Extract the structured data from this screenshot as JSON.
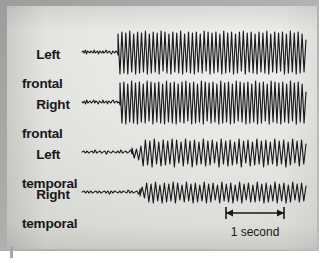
{
  "figure": {
    "background_color": "#b4b4b4",
    "plate_color": "#e7e7e4",
    "trace_color": "#1b1b1f",
    "label_color": "#17171a"
  },
  "channels": [
    {
      "line1": "Left",
      "line2": "frontal",
      "name": "left-frontal"
    },
    {
      "line1": "Right",
      "line2": "frontal",
      "name": "right-frontal"
    },
    {
      "line1": "Left",
      "line2": "temporal",
      "name": "left-temporal"
    },
    {
      "line1": "Right",
      "line2": "temporal",
      "name": "right-temporal"
    }
  ],
  "scale_bar": {
    "caption": "1 second",
    "x_start": 226,
    "x_end": 284,
    "y": 213
  },
  "chart_data": {
    "type": "line",
    "xlabel": "time",
    "ylabel": "amplitude",
    "grid": false,
    "legend": "none",
    "x_range": [
      82,
      306
    ],
    "scale_bar_seconds": 1,
    "scale_bar_pixels": 58,
    "series": [
      {
        "name": "Left frontal",
        "baseline_y": 52,
        "onset_x": 118,
        "preictal_amplitude": 3.5,
        "ictal_amplitude": 23,
        "spike_period_px": 12.2,
        "morphology": "spike-and-slow-wave",
        "values": [
          0,
          1,
          -1,
          2,
          -2,
          1,
          0,
          -1,
          1,
          0,
          -1,
          2,
          -1,
          0,
          1,
          -2,
          1,
          0,
          -1,
          1,
          -1,
          0,
          2,
          -1,
          0,
          1,
          -1,
          -2,
          1,
          0,
          -1,
          1,
          0,
          -3,
          18,
          -22,
          20,
          -21,
          19,
          -22,
          21,
          -20,
          18,
          -22,
          20,
          -21,
          19,
          -20,
          21,
          -22,
          18,
          -21,
          20,
          -20,
          19,
          -22,
          21,
          -19,
          20,
          -21,
          18,
          -22,
          20,
          -20,
          19,
          -21,
          21,
          -22,
          18,
          -20,
          20,
          -21,
          19,
          -22,
          20,
          -20,
          18,
          -21,
          21,
          -19,
          20,
          -22,
          19,
          -21,
          20,
          -20,
          18,
          -22,
          21,
          -21,
          19,
          -20,
          20,
          -22,
          18,
          -21,
          20,
          -19,
          21,
          -22,
          19,
          -20,
          20,
          -21,
          18,
          -22,
          20,
          -20,
          19,
          -21,
          21,
          -22,
          18,
          -20,
          20,
          -21,
          19,
          -19,
          20,
          -22,
          18,
          -21,
          21,
          -20,
          19,
          -22,
          20,
          -21,
          18,
          -20,
          12
        ]
      },
      {
        "name": "Right frontal",
        "baseline_y": 102,
        "onset_x": 120,
        "preictal_amplitude": 3.5,
        "ictal_amplitude": 23,
        "spike_period_px": 12.2,
        "morphology": "spike-and-slow-wave",
        "values": [
          0,
          -1,
          1,
          -2,
          2,
          -1,
          0,
          1,
          -1,
          0,
          2,
          -1,
          1,
          0,
          -2,
          1,
          0,
          -1,
          2,
          -1,
          0,
          1,
          -2,
          1,
          0,
          -1,
          1,
          2,
          -1,
          0,
          1,
          -1,
          0,
          -3,
          19,
          -21,
          20,
          -22,
          18,
          -20,
          21,
          -21,
          19,
          -22,
          20,
          -20,
          18,
          -21,
          21,
          -19,
          20,
          -22,
          19,
          -20,
          20,
          -21,
          18,
          -22,
          21,
          -20,
          19,
          -21,
          20,
          -22,
          18,
          -20,
          20,
          -21,
          21,
          -19,
          19,
          -22,
          20,
          -21,
          18,
          -20,
          21,
          -22,
          20,
          -19,
          19,
          -21,
          20,
          -20,
          18,
          -22,
          21,
          -21,
          19,
          -20,
          20,
          -22,
          18,
          -21,
          21,
          -19,
          20,
          -20,
          19,
          -22,
          20,
          -21,
          18,
          -20,
          21,
          -22,
          19,
          -21,
          20,
          -19,
          18,
          -22,
          21,
          -20,
          20,
          -21,
          19,
          -22,
          20,
          -20,
          18,
          -21,
          21,
          -19,
          19,
          -22,
          20,
          -20,
          18,
          -21,
          10
        ]
      },
      {
        "name": "Left temporal",
        "baseline_y": 152,
        "onset_x": 132,
        "preictal_amplitude": 3,
        "ictal_amplitude": 15,
        "spike_period_px": 11.0,
        "morphology": "polyspike-and-wave",
        "values": [
          0,
          1,
          -1,
          1,
          -1,
          0,
          1,
          -1,
          2,
          -1,
          0,
          1,
          -1,
          0,
          1,
          -2,
          1,
          0,
          -1,
          1,
          0,
          -1,
          1,
          -1,
          2,
          -1,
          0,
          1,
          -1,
          0,
          2,
          -2,
          4,
          -6,
          3,
          -8,
          6,
          -14,
          12,
          -13,
          11,
          -15,
          13,
          -12,
          10,
          -14,
          12,
          -13,
          11,
          -12,
          13,
          -15,
          12,
          -11,
          10,
          -14,
          13,
          -12,
          11,
          -15,
          12,
          -13,
          10,
          -12,
          13,
          -14,
          11,
          -13,
          12,
          -11,
          10,
          -15,
          13,
          -12,
          11,
          -14,
          12,
          -13,
          10,
          -12,
          13,
          -15,
          11,
          -11,
          12,
          -14,
          10,
          -13,
          13,
          -12,
          11,
          -15,
          12,
          -13,
          10,
          -12,
          13,
          -14,
          11,
          -12,
          12,
          -15,
          10,
          -13,
          13,
          -11,
          11,
          -14,
          12,
          -12,
          8
        ]
      },
      {
        "name": "Right temporal",
        "baseline_y": 192,
        "onset_x": 140,
        "preictal_amplitude": 2.5,
        "ictal_amplitude": 11,
        "spike_period_px": 10.5,
        "morphology": "irregular sharp-and-slow-wave",
        "values": [
          0,
          1,
          -1,
          1,
          -1,
          1,
          -1,
          0,
          1,
          -1,
          1,
          -1,
          0,
          1,
          -1,
          1,
          -2,
          1,
          -1,
          1,
          0,
          -1,
          1,
          -1,
          1,
          0,
          -1,
          2,
          -1,
          1,
          -1,
          0,
          1,
          -2,
          3,
          -4,
          5,
          -6,
          9,
          -10,
          8,
          -11,
          10,
          -9,
          7,
          -11,
          9,
          -10,
          8,
          -9,
          10,
          -11,
          9,
          -8,
          7,
          -10,
          10,
          -9,
          8,
          -11,
          9,
          -10,
          7,
          -9,
          10,
          -11,
          8,
          -10,
          9,
          -8,
          7,
          -11,
          10,
          -9,
          8,
          -10,
          9,
          -11,
          7,
          -9,
          10,
          -11,
          8,
          -8,
          9,
          -10,
          7,
          -10,
          10,
          -9,
          8,
          -11,
          9,
          -10,
          7,
          -9,
          10,
          -11,
          8,
          -9,
          9,
          -11,
          7,
          -10,
          10,
          -8,
          8,
          -10,
          9,
          -9,
          6
        ]
      }
    ]
  }
}
